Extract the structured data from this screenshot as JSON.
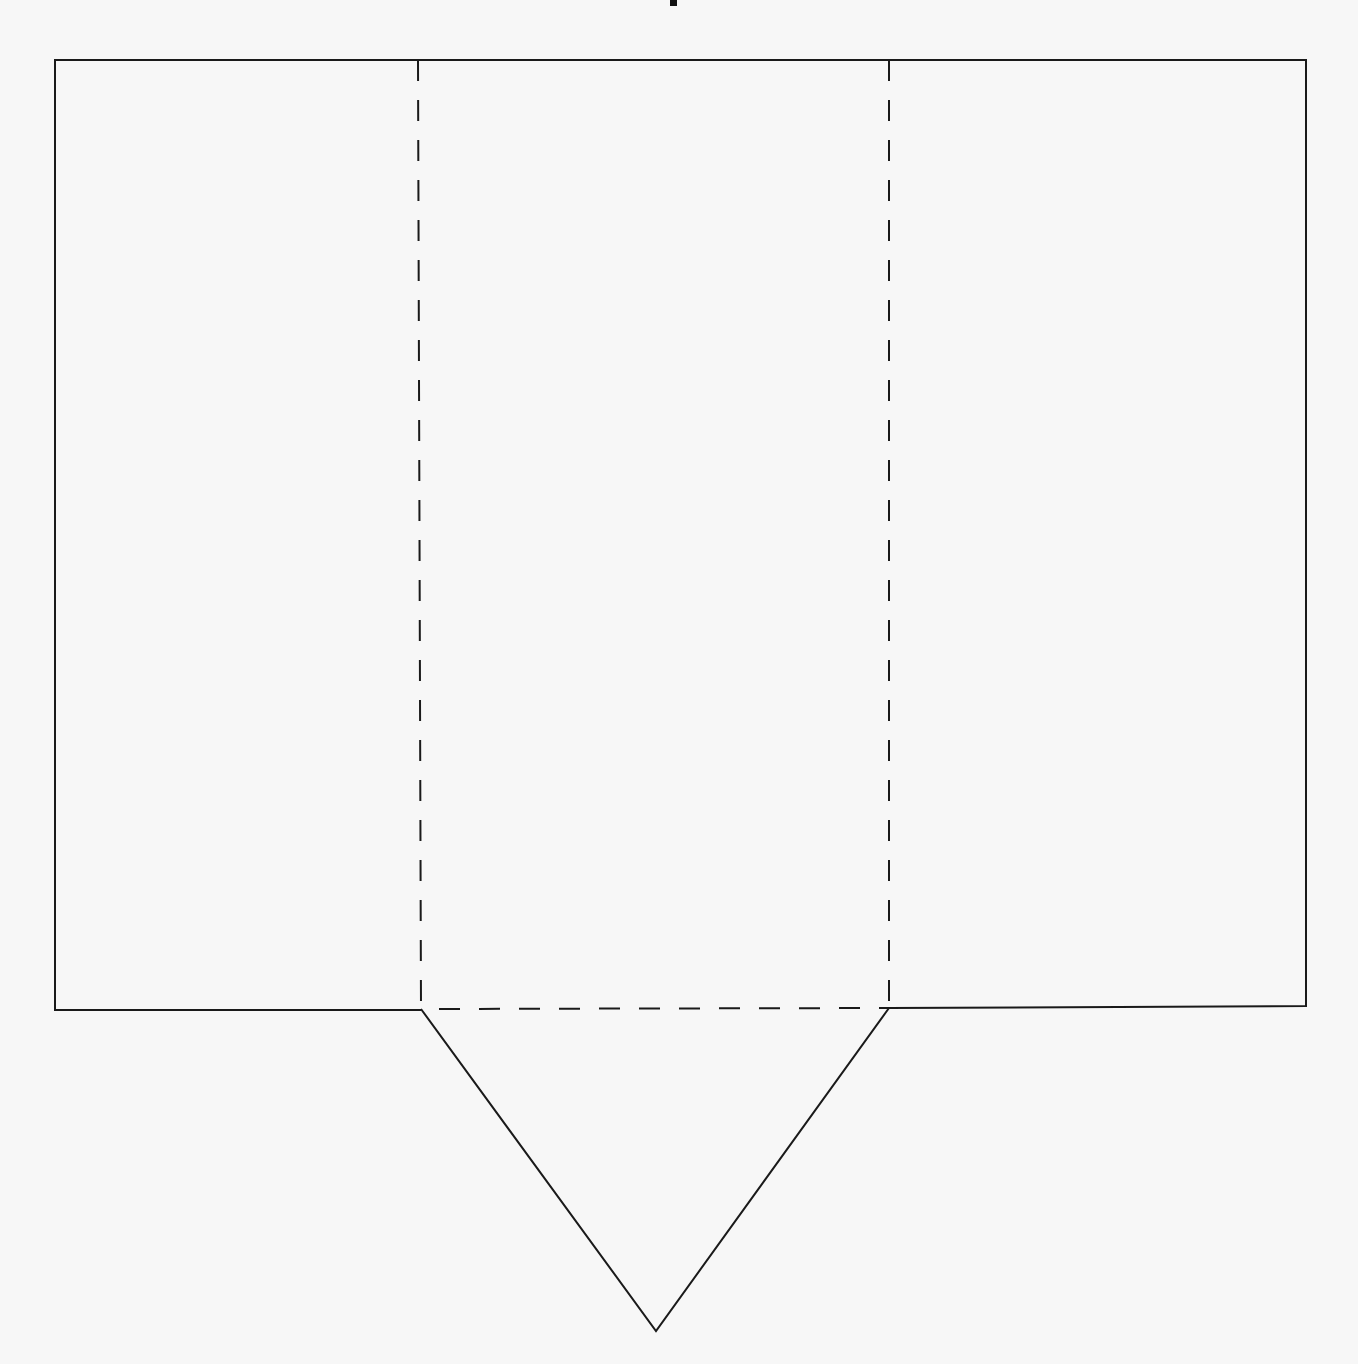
{
  "diagram": {
    "title": "",
    "colors": {
      "background": "#f7f7f7",
      "paper": "#ffffff",
      "stroke": "#1a1a1a"
    },
    "outline": {
      "left": 55,
      "top": 60,
      "right": 1306,
      "bottom_left": 1010,
      "bottom_right": 1006
    },
    "fold_lines": [
      {
        "x": 418,
        "y1": 60,
        "y2": 1009,
        "style": "dashed"
      },
      {
        "x": 889,
        "y1": 60,
        "y2": 1008,
        "style": "dashed"
      },
      {
        "y": 1009,
        "x1": 421,
        "x2": 889,
        "style": "dashed"
      }
    ],
    "flap": {
      "points": [
        [
          421,
          1009
        ],
        [
          656,
          1331
        ],
        [
          889,
          1008
        ]
      ]
    },
    "top_mark": {
      "x": 673,
      "y": 2
    }
  }
}
